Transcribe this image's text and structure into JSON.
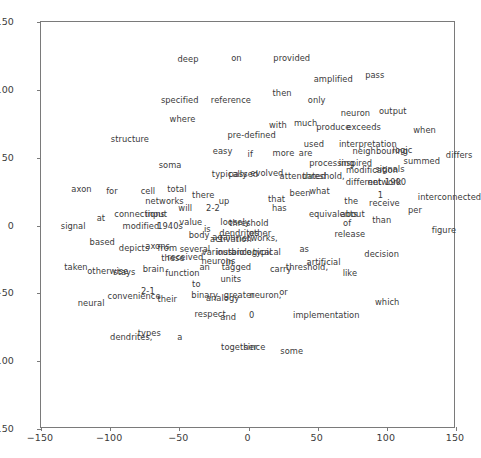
{
  "chart_data": {
    "type": "scatter",
    "title": "",
    "xlabel": "",
    "ylabel": "",
    "xlim": [
      -150,
      150
    ],
    "ylim": [
      -150,
      150
    ],
    "grid": false,
    "legend": null,
    "xticks": [
      -150,
      -100,
      -50,
      0,
      50,
      100,
      150
    ],
    "yticks": [
      -150,
      -100,
      -50,
      0,
      50,
      100,
      150
    ],
    "xticklabels": [
      "−150",
      "−100",
      "−50",
      "0",
      "50",
      "100",
      "150"
    ],
    "yticklabels": [
      "−150",
      "−100",
      "−50",
      "0",
      "50",
      "100",
      "150"
    ],
    "marker": "text",
    "point_labels": [
      {
        "text": "deep",
        "x": -43,
        "y": 122
      },
      {
        "text": "on",
        "x": -8,
        "y": 123
      },
      {
        "text": "provided",
        "x": 32,
        "y": 123
      },
      {
        "text": "amplified",
        "x": 62,
        "y": 107
      },
      {
        "text": "pass",
        "x": 92,
        "y": 110
      },
      {
        "text": "then",
        "x": 25,
        "y": 97
      },
      {
        "text": "specified",
        "x": -49,
        "y": 92
      },
      {
        "text": "reference",
        "x": -12,
        "y": 92
      },
      {
        "text": "only",
        "x": 50,
        "y": 92
      },
      {
        "text": "neuron",
        "x": 78,
        "y": 82
      },
      {
        "text": "output",
        "x": 105,
        "y": 84
      },
      {
        "text": "where",
        "x": -47,
        "y": 78
      },
      {
        "text": "with",
        "x": 22,
        "y": 73
      },
      {
        "text": "much",
        "x": 42,
        "y": 75
      },
      {
        "text": "produce",
        "x": 62,
        "y": 72
      },
      {
        "text": "exceeds",
        "x": 84,
        "y": 72
      },
      {
        "text": "when",
        "x": 128,
        "y": 70
      },
      {
        "text": "pre-defined",
        "x": 3,
        "y": 66
      },
      {
        "text": "structure",
        "x": -85,
        "y": 63
      },
      {
        "text": "interpretation",
        "x": 87,
        "y": 59
      },
      {
        "text": "neighbouring",
        "x": 96,
        "y": 54
      },
      {
        "text": "logic",
        "x": 112,
        "y": 55
      },
      {
        "text": "used",
        "x": 48,
        "y": 59
      },
      {
        "text": "easy",
        "x": -18,
        "y": 54
      },
      {
        "text": "if",
        "x": 2,
        "y": 52
      },
      {
        "text": "more",
        "x": 26,
        "y": 53
      },
      {
        "text": "are",
        "x": 42,
        "y": 53
      },
      {
        "text": "summed",
        "x": 126,
        "y": 47
      },
      {
        "text": "differs",
        "x": 153,
        "y": 51
      },
      {
        "text": "soma",
        "x": -56,
        "y": 44
      },
      {
        "text": "processing",
        "x": 61,
        "y": 45
      },
      {
        "text": "inspired",
        "x": 78,
        "y": 45
      },
      {
        "text": "modification",
        "x": 90,
        "y": 40
      },
      {
        "text": "signals",
        "x": 103,
        "y": 41
      },
      {
        "text": "typically",
        "x": -13,
        "y": 37
      },
      {
        "text": "passed",
        "x": -3,
        "y": 37
      },
      {
        "text": "evolved",
        "x": 14,
        "y": 38
      },
      {
        "text": "attenuated",
        "x": 40,
        "y": 36
      },
      {
        "text": "threshold,",
        "x": 55,
        "y": 36
      },
      {
        "text": "different",
        "x": 84,
        "y": 31
      },
      {
        "text": "network",
        "x": 99,
        "y": 31
      },
      {
        "text": "1900",
        "x": 107,
        "y": 31
      },
      {
        "text": "axon",
        "x": -120,
        "y": 26
      },
      {
        "text": "for",
        "x": -98,
        "y": 25
      },
      {
        "text": "cell",
        "x": -72,
        "y": 25
      },
      {
        "text": "total",
        "x": -51,
        "y": 26
      },
      {
        "text": "there",
        "x": -32,
        "y": 22
      },
      {
        "text": "been",
        "x": 38,
        "y": 23
      },
      {
        "text": "what",
        "x": 52,
        "y": 25
      },
      {
        "text": "1",
        "x": 96,
        "y": 22
      },
      {
        "text": "receive",
        "x": 99,
        "y": 16
      },
      {
        "text": "interconnected",
        "x": 146,
        "y": 20
      },
      {
        "text": "networks",
        "x": -60,
        "y": 17
      },
      {
        "text": "up",
        "x": -17,
        "y": 17
      },
      {
        "text": "that",
        "x": 21,
        "y": 19
      },
      {
        "text": "the",
        "x": 75,
        "y": 17
      },
      {
        "text": "will",
        "x": -45,
        "y": 12
      },
      {
        "text": "2-2",
        "x": -25,
        "y": 12
      },
      {
        "text": "has",
        "x": 23,
        "y": 12
      },
      {
        "text": "per",
        "x": 121,
        "y": 11
      },
      {
        "text": "connections",
        "x": -78,
        "y": 8
      },
      {
        "text": "input",
        "x": -66,
        "y": 8
      },
      {
        "text": "equivalents",
        "x": 62,
        "y": 8
      },
      {
        "text": "about",
        "x": 76,
        "y": 8
      },
      {
        "text": "at",
        "x": -106,
        "y": 5
      },
      {
        "text": "value",
        "x": -41,
        "y": 2
      },
      {
        "text": "loosely",
        "x": -9,
        "y": 2
      },
      {
        "text": "threshold",
        "x": 1,
        "y": 1
      },
      {
        "text": "of",
        "x": 72,
        "y": 1
      },
      {
        "text": "than",
        "x": 97,
        "y": 3
      },
      {
        "text": "signal",
        "x": -126,
        "y": -1
      },
      {
        "text": "modified",
        "x": -77,
        "y": -1
      },
      {
        "text": "1940s",
        "x": -56,
        "y": -1
      },
      {
        "text": "is",
        "x": -29,
        "y": -3
      },
      {
        "text": "dendrites",
        "x": -6,
        "y": -6
      },
      {
        "text": "other",
        "x": 9,
        "y": -6
      },
      {
        "text": "release",
        "x": 74,
        "y": -7
      },
      {
        "text": "figure",
        "x": 142,
        "y": -4
      },
      {
        "text": "body",
        "x": -35,
        "y": -8
      },
      {
        "text": "again",
        "x": -17,
        "y": -9
      },
      {
        "text": "activation",
        "x": -12,
        "y": -11
      },
      {
        "text": "networks,",
        "x": 7,
        "y": -10
      },
      {
        "text": "based",
        "x": -105,
        "y": -13
      },
      {
        "text": "depicts",
        "x": -82,
        "y": -17
      },
      {
        "text": "axons",
        "x": -65,
        "y": -16
      },
      {
        "text": "from",
        "x": -58,
        "y": -17
      },
      {
        "text": "several",
        "x": -38,
        "y": -18
      },
      {
        "text": "various",
        "x": -22,
        "y": -20
      },
      {
        "text": "instance,",
        "x": -9,
        "y": -20
      },
      {
        "text": "biological",
        "x": 3,
        "y": -20
      },
      {
        "text": "typical",
        "x": 14,
        "y": -20
      },
      {
        "text": "as",
        "x": 41,
        "y": -18
      },
      {
        "text": "decision",
        "x": 97,
        "y": -22
      },
      {
        "text": "these",
        "x": -54,
        "y": -25
      },
      {
        "text": "received",
        "x": -45,
        "y": -24
      },
      {
        "text": "neurons",
        "x": -21,
        "y": -27
      },
      {
        "text": "in",
        "x": -13,
        "y": -28
      },
      {
        "text": "artificial",
        "x": 55,
        "y": -28
      },
      {
        "text": "taken",
        "x": -124,
        "y": -31
      },
      {
        "text": "an",
        "x": -31,
        "y": -31
      },
      {
        "text": "tagged",
        "x": -8,
        "y": -31
      },
      {
        "text": "carry",
        "x": 24,
        "y": -33
      },
      {
        "text": "threshold,",
        "x": 43,
        "y": -31
      },
      {
        "text": "otherwise",
        "x": -101,
        "y": -34
      },
      {
        "text": "stays",
        "x": -89,
        "y": -35
      },
      {
        "text": "brain",
        "x": -68,
        "y": -33
      },
      {
        "text": "function",
        "x": -47,
        "y": -36
      },
      {
        "text": "like",
        "x": 74,
        "y": -36
      },
      {
        "text": "units",
        "x": -12,
        "y": -40
      },
      {
        "text": "to",
        "x": -37,
        "y": -44
      },
      {
        "text": "2-1",
        "x": -72,
        "y": -49
      },
      {
        "text": "convenience",
        "x": -82,
        "y": -53
      },
      {
        "text": "binary",
        "x": -31,
        "y": -52
      },
      {
        "text": "analogy",
        "x": -18,
        "y": -54
      },
      {
        "text": "greater",
        "x": -6,
        "y": -52
      },
      {
        "text": "neuron,",
        "x": 13,
        "y": -52
      },
      {
        "text": "or",
        "x": 26,
        "y": -50
      },
      {
        "text": "their",
        "x": -58,
        "y": -55
      },
      {
        "text": "neural",
        "x": -113,
        "y": -58
      },
      {
        "text": "which",
        "x": 101,
        "y": -57
      },
      {
        "text": "respect",
        "x": -27,
        "y": -66
      },
      {
        "text": "and",
        "x": -14,
        "y": -68
      },
      {
        "text": "0",
        "x": 3,
        "y": -67
      },
      {
        "text": "implementation",
        "x": 57,
        "y": -67
      },
      {
        "text": "types",
        "x": -71,
        "y": -80
      },
      {
        "text": "dendrites,",
        "x": -84,
        "y": -83
      },
      {
        "text": "a",
        "x": -49,
        "y": -83
      },
      {
        "text": "together",
        "x": -6,
        "y": -90
      },
      {
        "text": "since",
        "x": 5,
        "y": -90
      },
      {
        "text": "some",
        "x": 32,
        "y": -93
      }
    ]
  }
}
